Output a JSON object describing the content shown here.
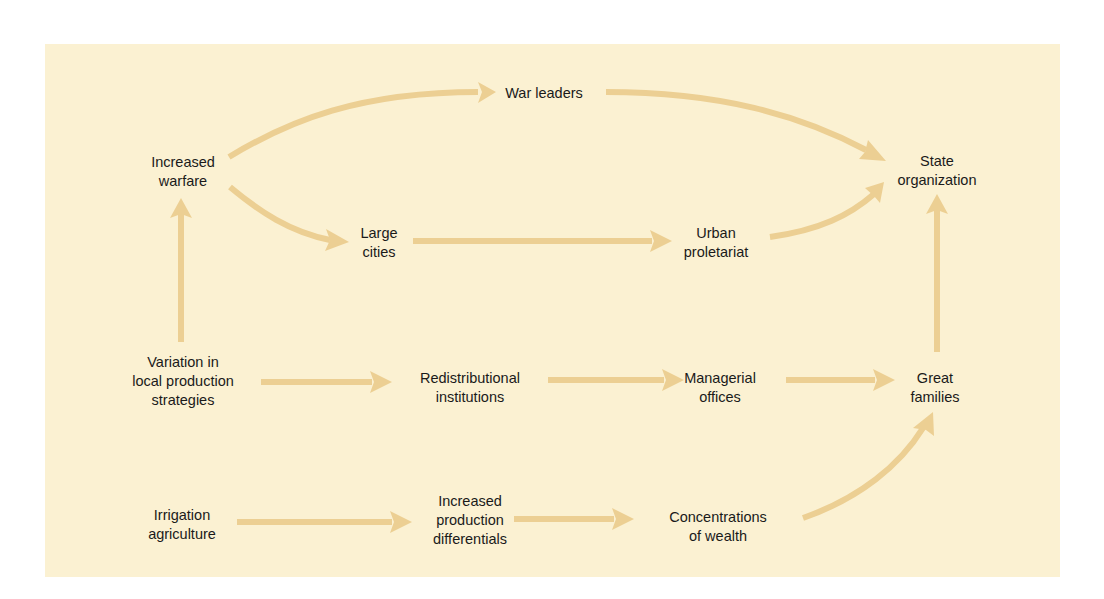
{
  "diagram": {
    "colors": {
      "page_background": "#ffffff",
      "panel_background": "#fbf1d2",
      "arrow": "#eccf93",
      "text": "#1a1a1a"
    },
    "nodes": [
      {
        "id": "increased-warfare",
        "lines": [
          "Increased",
          "warfare"
        ],
        "x": 183,
        "y": 172
      },
      {
        "id": "war-leaders",
        "lines": [
          "War leaders"
        ],
        "x": 544,
        "y": 93
      },
      {
        "id": "state-organization",
        "lines": [
          "State",
          "organization"
        ],
        "x": 937,
        "y": 171
      },
      {
        "id": "large-cities",
        "lines": [
          "Large",
          "cities"
        ],
        "x": 379,
        "y": 243
      },
      {
        "id": "urban-proletariat",
        "lines": [
          "Urban",
          "proletariat"
        ],
        "x": 716,
        "y": 243
      },
      {
        "id": "variation-local-production",
        "lines": [
          "Variation in",
          "local production",
          "strategies"
        ],
        "x": 183,
        "y": 381
      },
      {
        "id": "redistributional-institutions",
        "lines": [
          "Redistributional",
          "institutions"
        ],
        "x": 470,
        "y": 388
      },
      {
        "id": "managerial-offices",
        "lines": [
          "Managerial",
          "offices"
        ],
        "x": 720,
        "y": 388
      },
      {
        "id": "great-families",
        "lines": [
          "Great",
          "families"
        ],
        "x": 935,
        "y": 388
      },
      {
        "id": "irrigation-agriculture",
        "lines": [
          "Irrigation",
          "agriculture"
        ],
        "x": 182,
        "y": 525
      },
      {
        "id": "increased-production-differentials",
        "lines": [
          "Increased",
          "production",
          "differentials"
        ],
        "x": 470,
        "y": 520
      },
      {
        "id": "concentrations-of-wealth",
        "lines": [
          "Concentrations",
          "of wealth"
        ],
        "x": 718,
        "y": 527
      }
    ],
    "edges": [
      {
        "from": "increased-warfare",
        "to": "war-leaders",
        "shape": "curve"
      },
      {
        "from": "war-leaders",
        "to": "state-organization",
        "shape": "curve"
      },
      {
        "from": "increased-warfare",
        "to": "large-cities",
        "shape": "curve"
      },
      {
        "from": "large-cities",
        "to": "urban-proletariat",
        "shape": "straight"
      },
      {
        "from": "urban-proletariat",
        "to": "state-organization",
        "shape": "curve"
      },
      {
        "from": "variation-local-production",
        "to": "increased-warfare",
        "shape": "straight"
      },
      {
        "from": "variation-local-production",
        "to": "redistributional-institutions",
        "shape": "straight"
      },
      {
        "from": "redistributional-institutions",
        "to": "managerial-offices",
        "shape": "straight"
      },
      {
        "from": "managerial-offices",
        "to": "great-families",
        "shape": "straight"
      },
      {
        "from": "great-families",
        "to": "state-organization",
        "shape": "straight"
      },
      {
        "from": "irrigation-agriculture",
        "to": "increased-production-differentials",
        "shape": "straight"
      },
      {
        "from": "increased-production-differentials",
        "to": "concentrations-of-wealth",
        "shape": "straight"
      },
      {
        "from": "concentrations-of-wealth",
        "to": "great-families",
        "shape": "curve"
      }
    ]
  }
}
